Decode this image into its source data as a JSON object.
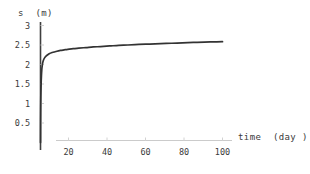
{
  "chart_data": {
    "type": "line",
    "title": "",
    "xlabel": "time  (day )",
    "ylabel": "s  (m)",
    "xlim": [
      0,
      105
    ],
    "ylim": [
      0,
      3
    ],
    "grid": false,
    "legend": null,
    "x_ticks": [
      20,
      40,
      60,
      80,
      100
    ],
    "x_tick_labels": [
      "20",
      "40",
      "60",
      "80",
      "100"
    ],
    "y_ticks": [
      0.5,
      1,
      1.5,
      2,
      2.5,
      3
    ],
    "y_tick_labels": [
      "0.5",
      "1",
      "1.5",
      "2",
      "2.5",
      "3"
    ],
    "series": [
      {
        "name": "settlement",
        "color": "#333333",
        "x": [
          0,
          0.05,
          0.1,
          0.2,
          0.35,
          0.5,
          0.7,
          0.9,
          1.2,
          1.6,
          2.0,
          2.6,
          3.2,
          4.0,
          5.0,
          6.0,
          7.5,
          9.0,
          11.0,
          13.0,
          15.0,
          18.0,
          21.0,
          25.0,
          29.0,
          33.0,
          38.0,
          43.0,
          48.0,
          54.0,
          60.0,
          66.0,
          72.0,
          78.0,
          84.0,
          90.0,
          95.0,
          100.0
        ],
        "y": [
          0.0,
          0.55,
          0.85,
          1.22,
          1.52,
          1.7,
          1.86,
          1.95,
          2.04,
          2.11,
          2.15,
          2.19,
          2.22,
          2.25,
          2.28,
          2.3,
          2.32,
          2.34,
          2.36,
          2.375,
          2.39,
          2.405,
          2.42,
          2.435,
          2.45,
          2.46,
          2.475,
          2.49,
          2.5,
          2.515,
          2.525,
          2.535,
          2.545,
          2.555,
          2.565,
          2.575,
          2.58,
          2.585
        ]
      }
    ],
    "annotations": [],
    "style": {
      "axis_color": "#3a3a3a",
      "x_axis_color": "#c9c9c9",
      "tick_color": "#cfcfcf",
      "curve_color": "#333333",
      "background": "#ffffff"
    }
  }
}
